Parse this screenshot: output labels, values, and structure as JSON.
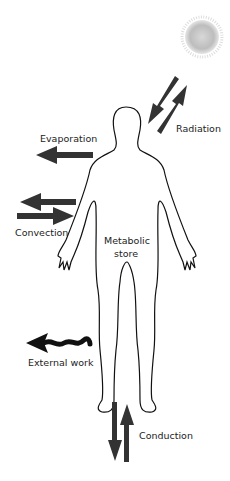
{
  "labels": {
    "radiation": "Radiation",
    "evaporation": "Evaporation",
    "convection": "Convection",
    "metabolic_line1": "Metabolic",
    "metabolic_line2": "store",
    "external_work": "External work",
    "conduction": "Conduction"
  },
  "colors": {
    "arrow": "#333333",
    "outline": "#111111",
    "sun_core": "#bdbdbd"
  }
}
